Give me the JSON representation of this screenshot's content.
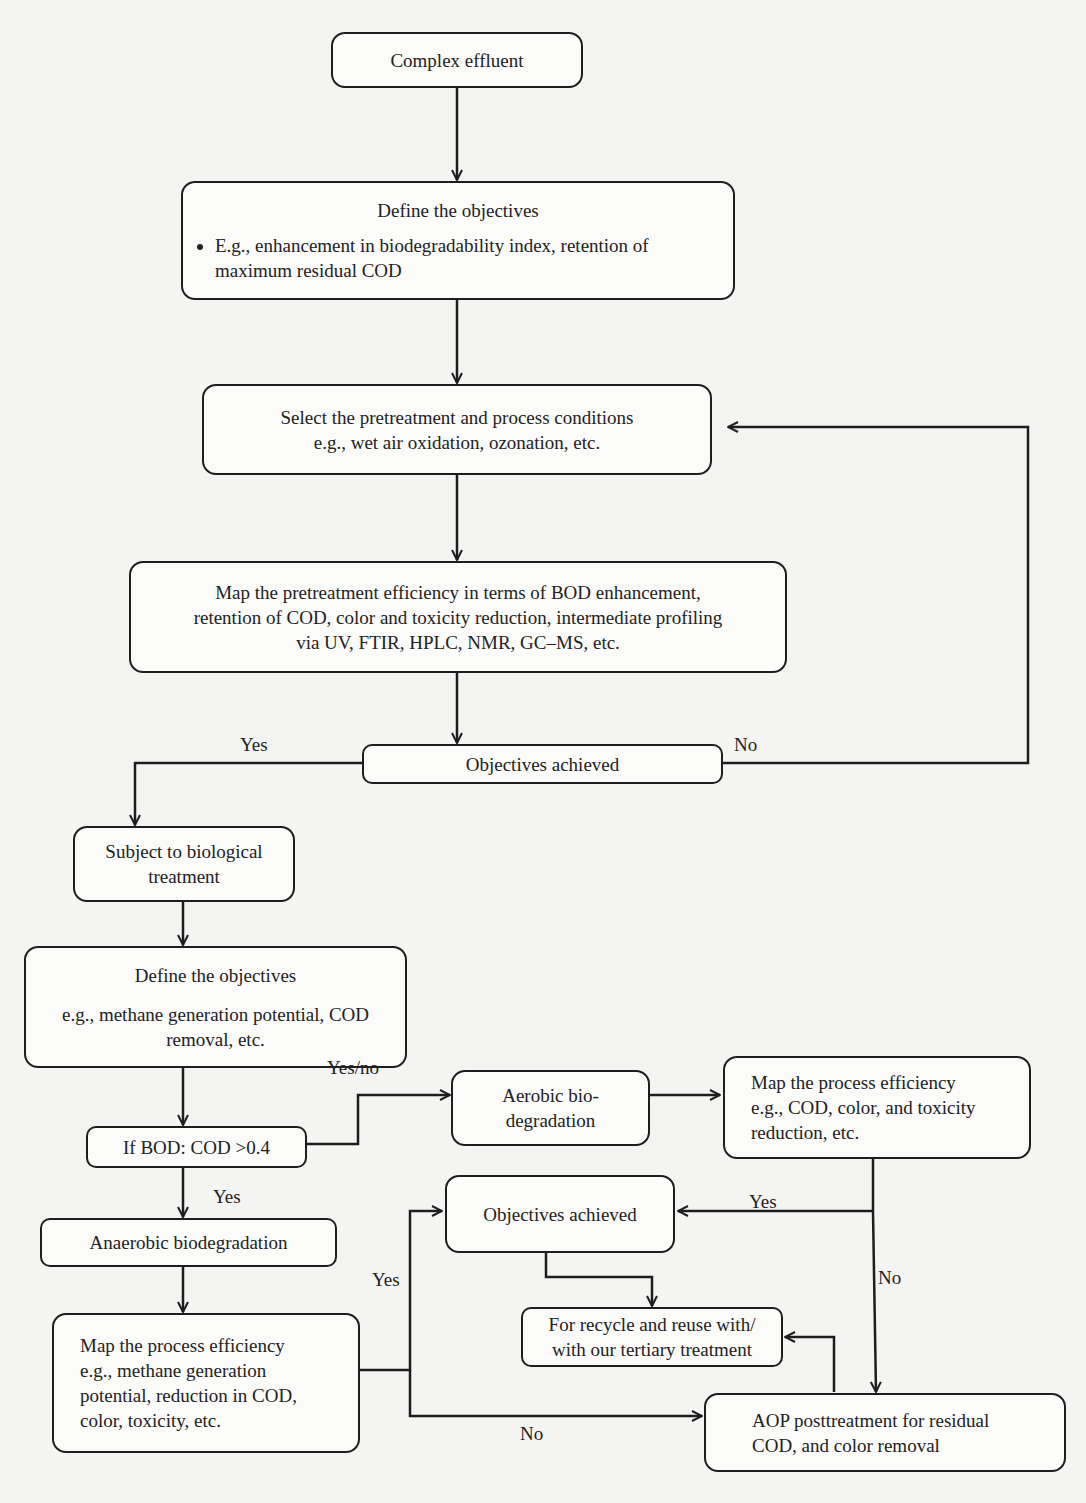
{
  "diagram": {
    "nodes": {
      "complex_effluent": {
        "text": "Complex effluent"
      },
      "define_objectives_1": {
        "title": "Define the objectives",
        "bullet": "E.g., enhancement in biodegradability index, retention of maximum residual COD"
      },
      "select_pretreatment": {
        "line1": "Select the pretreatment and process conditions",
        "line2": "e.g., wet air oxidation, ozonation, etc."
      },
      "map_pretreatment": {
        "line1": "Map the pretreatment efficiency in terms of BOD enhancement,",
        "line2": "retention of COD, color and toxicity reduction, intermediate profiling",
        "line3": "via UV, FTIR, HPLC, NMR, GC–MS, etc."
      },
      "objectives_achieved_1": {
        "text": "Objectives achieved"
      },
      "subject_biological": {
        "line1": "Subject to biological",
        "line2": "treatment"
      },
      "define_objectives_2": {
        "title": "Define the objectives",
        "line1": "e.g., methane generation potential, COD",
        "line2": "removal, etc."
      },
      "if_bod_cod": {
        "text": "If BOD: COD >0.4"
      },
      "aerobic": {
        "line1": "Aerobic bio-",
        "line2": "degradation"
      },
      "map_process_aerobic": {
        "line1": "Map the process efficiency",
        "line2": "e.g., COD, color, and toxicity",
        "line3": "reduction, etc."
      },
      "anaerobic": {
        "text": "Anaerobic biodegradation"
      },
      "objectives_achieved_2": {
        "text": "Objectives achieved"
      },
      "recycle_reuse": {
        "line1": "For recycle and reuse with/",
        "line2": "with our tertiary treatment"
      },
      "map_process_anaerobic": {
        "line1": "Map the process efficiency",
        "line2": "e.g., methane generation",
        "line3": "potential, reduction in COD,",
        "line4": "color, toxicity, etc."
      },
      "aop_posttreatment": {
        "line1": "AOP posttreatment for residual",
        "line2": "COD, and color removal"
      }
    },
    "edge_labels": {
      "obj1_yes": "Yes",
      "obj1_no": "No",
      "bod_yesno": "Yes/no",
      "bod_yes": "Yes",
      "anaerobic_yes": "Yes",
      "anaerobic_no": "No",
      "aerobic_yes": "Yes",
      "aerobic_no": "No"
    },
    "colors": {
      "stroke": "#1e1e1e",
      "box_fill": "#fbfbfa",
      "background": "#f4f4f2",
      "text": "#222222"
    }
  }
}
